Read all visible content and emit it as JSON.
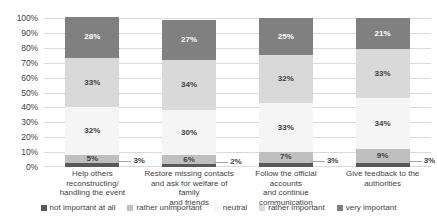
{
  "chart_data": {
    "type": "bar",
    "subtype": "100% stacked column",
    "title": "",
    "xlabel": "",
    "ylabel": "",
    "ylim": [
      0,
      100
    ],
    "ytick_labels": [
      "100%",
      "90%",
      "80%",
      "70%",
      "60%",
      "50%",
      "40%",
      "30%",
      "20%",
      "10%",
      "0%"
    ],
    "ytick_values": [
      100,
      90,
      80,
      70,
      60,
      50,
      40,
      30,
      20,
      10,
      0
    ],
    "grid": true,
    "legend_position": "bottom",
    "categories": [
      "Help others reconstructing/ handling the event",
      "Restore missing contacts and ask for welfare of family and friends",
      "Follow the official accounts and continue communication",
      "Give feedback to the authorities"
    ],
    "category_lines": [
      [
        "Help others reconstructing/",
        "handling the event"
      ],
      [
        "Restore missing contacts",
        "and ask for welfare of family",
        "and friends"
      ],
      [
        "Follow the official accounts",
        "and continue",
        "communication"
      ],
      [
        "Give feedback to the",
        "authorities"
      ]
    ],
    "series": [
      {
        "name": "not important at all",
        "color": "#595959",
        "label_color": "dark",
        "values": [
          3,
          2,
          3,
          3
        ],
        "labels": [
          "3%",
          "2%",
          "3%",
          "3%"
        ],
        "label_style": "callout"
      },
      {
        "name": "rather unimportant",
        "color": "#bfbfbf",
        "label_color": "light",
        "values": [
          5,
          6,
          7,
          9
        ],
        "labels": [
          "5%",
          "6%",
          "7%",
          "9%"
        ],
        "label_style": "inside"
      },
      {
        "name": "neutral",
        "color": "#f5f5f5",
        "label_color": "light",
        "values": [
          32,
          30,
          33,
          34
        ],
        "labels": [
          "32%",
          "30%",
          "33%",
          "34%"
        ],
        "label_style": "inside"
      },
      {
        "name": "rather important",
        "color": "#d9d9d9",
        "label_color": "light",
        "values": [
          33,
          34,
          32,
          33
        ],
        "labels": [
          "33%",
          "34%",
          "32%",
          "33%"
        ],
        "label_style": "inside"
      },
      {
        "name": "very important",
        "color": "#808080",
        "label_color": "dark",
        "values": [
          28,
          27,
          25,
          21
        ],
        "labels": [
          "28%",
          "27%",
          "25%",
          "21%"
        ],
        "label_style": "inside"
      }
    ],
    "legend": [
      {
        "label": "not important at all",
        "color": "#595959"
      },
      {
        "label": "rather unimportant",
        "color": "#bfbfbf"
      },
      {
        "label": "neutral",
        "color": "#f5f5f5"
      },
      {
        "label": "rather important",
        "color": "#d9d9d9"
      },
      {
        "label": "very important",
        "color": "#808080"
      }
    ],
    "colors": {
      "gridline": "#d9d9d9",
      "text": "#3f3f3f",
      "background": "#ffffff",
      "leader_line": "#a6a6a6"
    }
  }
}
